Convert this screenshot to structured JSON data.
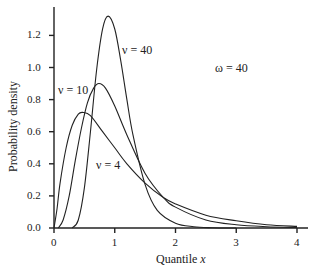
{
  "chart_data": {
    "type": "line",
    "title": "",
    "xlabel": "Quantile x",
    "ylabel": "Probability density",
    "xlim": [
      0,
      4.2
    ],
    "ylim": [
      0,
      1.38
    ],
    "x_ticks": [
      "0",
      "1",
      "2",
      "3",
      "4"
    ],
    "y_ticks": [
      "0.0",
      "0.2",
      "0.4",
      "0.6",
      "0.8",
      "1.0",
      "1.2"
    ],
    "grid": false,
    "annotation": "ω = 40",
    "series": [
      {
        "name": "ν = 4",
        "x": [
          0,
          0.05,
          0.1,
          0.2,
          0.3,
          0.4,
          0.48,
          0.6,
          0.8,
          1.0,
          1.2,
          1.5,
          1.8,
          2.0,
          2.5,
          3.0,
          3.5,
          4.0
        ],
        "y": [
          0,
          0.12,
          0.28,
          0.5,
          0.64,
          0.71,
          0.72,
          0.7,
          0.6,
          0.5,
          0.4,
          0.28,
          0.19,
          0.15,
          0.08,
          0.045,
          0.02,
          0.01
        ]
      },
      {
        "name": "ν = 10",
        "x": [
          0.07,
          0.15,
          0.25,
          0.35,
          0.45,
          0.55,
          0.65,
          0.74,
          0.85,
          1.0,
          1.2,
          1.5,
          1.8,
          2.0,
          2.5,
          3.0,
          3.5,
          4.0
        ],
        "y": [
          0,
          0.05,
          0.2,
          0.42,
          0.62,
          0.78,
          0.87,
          0.9,
          0.87,
          0.76,
          0.58,
          0.34,
          0.19,
          0.13,
          0.05,
          0.02,
          0.008,
          0.003
        ]
      },
      {
        "name": "ν = 40",
        "x": [
          0.3,
          0.4,
          0.5,
          0.6,
          0.7,
          0.8,
          0.89,
          1.0,
          1.1,
          1.2,
          1.3,
          1.5,
          1.7,
          2.0,
          2.3,
          2.6,
          3.0
        ],
        "y": [
          0,
          0.05,
          0.25,
          0.6,
          0.98,
          1.24,
          1.32,
          1.24,
          1.04,
          0.8,
          0.58,
          0.27,
          0.11,
          0.03,
          0.008,
          0.002,
          0
        ]
      }
    ]
  },
  "labels": {
    "nu40": "ν = 40",
    "nu10": "ν = 10",
    "nu4": "ν = 4",
    "omega": "ω = 40",
    "xlabel": "Quantile x",
    "ylabel": "Probability density"
  }
}
